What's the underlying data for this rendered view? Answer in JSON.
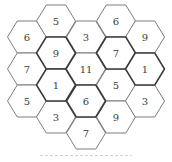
{
  "figure": {
    "type": "hexagon-number-grid",
    "hex_count": 18,
    "colors": {
      "line": "#6e6e6e",
      "bold_line": "#3a3a3a",
      "text": "#3c3c3c",
      "background": "#ffffff"
    },
    "columns": [
      {
        "x": 27,
        "cells": [
          {
            "label": "6",
            "y": 37
          },
          {
            "label": "7",
            "y": 69
          },
          {
            "label": "5",
            "y": 101
          }
        ]
      },
      {
        "x": 56,
        "cells": [
          {
            "label": "5",
            "y": 21
          },
          {
            "label": "9",
            "y": 53,
            "bold": true
          },
          {
            "label": "1",
            "y": 85,
            "bold": true
          },
          {
            "label": "3",
            "y": 117
          }
        ]
      },
      {
        "x": 86,
        "cells": [
          {
            "label": "3",
            "y": 37
          },
          {
            "label": "11",
            "y": 69
          },
          {
            "label": "6",
            "y": 101,
            "bold": true
          },
          {
            "label": "7",
            "y": 133
          }
        ]
      },
      {
        "x": 116,
        "cells": [
          {
            "label": "6",
            "y": 21
          },
          {
            "label": "7",
            "y": 53,
            "bold": true
          },
          {
            "label": "5",
            "y": 85
          },
          {
            "label": "9",
            "y": 117
          }
        ]
      },
      {
        "x": 145,
        "cells": [
          {
            "label": "9",
            "y": 37
          },
          {
            "label": "1",
            "y": 69,
            "bold": true
          },
          {
            "label": "3",
            "y": 101
          }
        ]
      }
    ]
  }
}
